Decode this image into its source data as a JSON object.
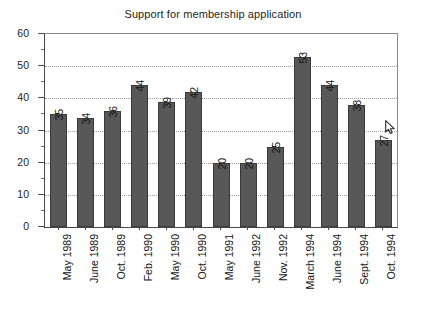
{
  "chart_data": {
    "type": "bar",
    "title": "Support for membership application",
    "xlabel": "",
    "ylabel": "",
    "categories": [
      "May 1989",
      "June 1989",
      "Oct. 1989",
      "Feb. 1990",
      "May 1990",
      "Oct. 1990",
      "May 1991",
      "June 1992",
      "Nov. 1992",
      "March 1994",
      "June 1994",
      "Sept. 1994",
      "Oct. 1994"
    ],
    "values": [
      35,
      34,
      36,
      44,
      39,
      42,
      20,
      20,
      25,
      53,
      44,
      38,
      27
    ],
    "ylim": [
      0,
      60
    ],
    "ytick_labels": [
      "0",
      "10",
      "20",
      "30",
      "40",
      "50",
      "60"
    ],
    "ytick_values": [
      0,
      10,
      20,
      30,
      40,
      50,
      60
    ],
    "yminor_step": 5,
    "grid": true,
    "grid_axis": "y",
    "legend": null,
    "bar_color": "#585858",
    "bar_edge_color": "#3a3a3a",
    "grid_color": "#9b9b9b",
    "axis_color": "#4a4a4a",
    "background_color": "#ffffff",
    "data_labels_rotated": true
  },
  "icons": {
    "cursor": "mouse-pointer-icon"
  }
}
